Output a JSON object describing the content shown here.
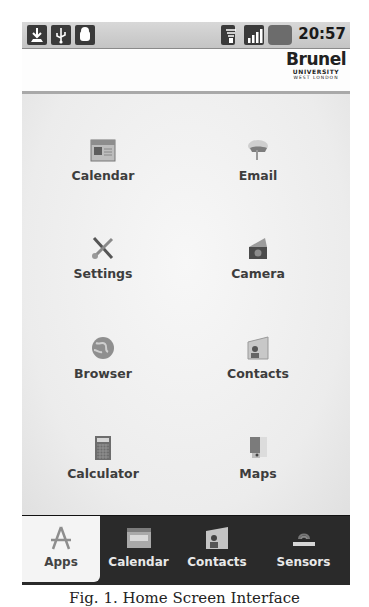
{
  "status_bar": {
    "left_icons": [
      "download-icon",
      "usb-icon",
      "android-icon"
    ],
    "right_icons": [
      "wifi-icon",
      "signal-icon",
      "battery-icon"
    ],
    "time": "20:57"
  },
  "header": {
    "brand_name": "Brunel",
    "brand_line1": "UNIVERSITY",
    "brand_line2": "WEST LONDON"
  },
  "apps": [
    {
      "label": "Calendar",
      "icon": "calendar-icon"
    },
    {
      "label": "Email",
      "icon": "email-icon"
    },
    {
      "label": "Settings",
      "icon": "settings-icon"
    },
    {
      "label": "Camera",
      "icon": "camera-icon"
    },
    {
      "label": "Browser",
      "icon": "browser-icon"
    },
    {
      "label": "Contacts",
      "icon": "contacts-icon"
    },
    {
      "label": "Calculator",
      "icon": "calculator-icon"
    },
    {
      "label": "Maps",
      "icon": "maps-icon"
    }
  ],
  "tabs": [
    {
      "label": "Apps",
      "icon": "apps-icon",
      "active": true
    },
    {
      "label": "Calendar",
      "icon": "calendar-icon",
      "active": false
    },
    {
      "label": "Contacts",
      "icon": "contacts-icon",
      "active": false
    },
    {
      "label": "Sensors",
      "icon": "sensors-icon",
      "active": false
    }
  ],
  "caption": "Fig. 1. Home Screen Interface"
}
